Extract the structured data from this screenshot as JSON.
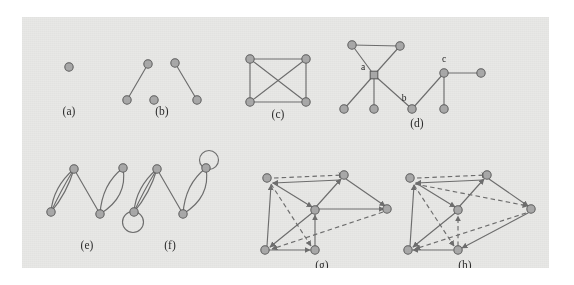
{
  "figure": {
    "background_color": "#ffffff",
    "panel_color": "#e8e8e6",
    "node_fill": "#a9a9a9",
    "node_stroke": "#5d5d5d",
    "edge_color": "#6e6e6e",
    "label_color": "#2b2b2b"
  },
  "captions": {
    "a": "(a)",
    "b": "(b)",
    "c": "(c)",
    "d": "(d)",
    "e": "(e)",
    "f": "(f)",
    "g": "(g)",
    "h": "(h)"
  },
  "vertex_labels": {
    "d_a": "a",
    "d_b": "b",
    "d_c": "c"
  },
  "panels": [
    {
      "id": "a",
      "caption": "(a)",
      "type": "undirected",
      "description": "single isolated vertex",
      "node_count": 1,
      "edge_count": 0
    },
    {
      "id": "b",
      "caption": "(b)",
      "type": "undirected",
      "description": "two disjoint edges and one isolated vertex",
      "node_count": 5,
      "edge_count": 2
    },
    {
      "id": "c",
      "caption": "(c)",
      "type": "undirected",
      "description": "complete graph on four vertices drawn as a square with both diagonals",
      "node_count": 4,
      "edge_count": 6
    },
    {
      "id": "d",
      "caption": "(d)",
      "type": "undirected",
      "description": "tree-like graph with a triangle, labelled vertices a, b and c",
      "node_count": 9,
      "edge_count": 9,
      "labelled_vertices": [
        "a",
        "b",
        "c"
      ]
    },
    {
      "id": "e",
      "caption": "(e)",
      "type": "multigraph",
      "description": "multigraph with parallel edges, no self loops",
      "node_count": 4,
      "edge_count": 6
    },
    {
      "id": "f",
      "caption": "(f)",
      "type": "pseudograph",
      "description": "multigraph with parallel edges plus two self loops",
      "node_count": 4,
      "edge_count": 8,
      "self_loops": 2
    },
    {
      "id": "g",
      "caption": "(g)",
      "type": "directed",
      "description": "directed graph with solid and dashed arcs",
      "node_count": 6,
      "edge_count": 12
    },
    {
      "id": "h",
      "caption": "(h)",
      "type": "directed",
      "description": "directed graph with solid and dashed arcs",
      "node_count": 6,
      "edge_count": 13
    }
  ]
}
